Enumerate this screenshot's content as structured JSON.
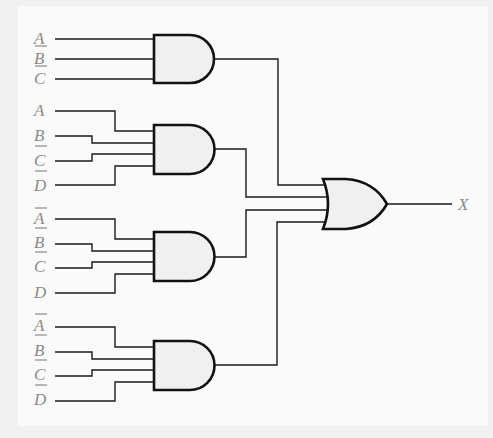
{
  "diagram": {
    "type": "logic-circuit",
    "output_label": "X",
    "colors": {
      "wire": "#1a1a1a",
      "gate_fill": "#f0f0f0",
      "label": "#8a8a8a",
      "background": "#f1f1f1"
    },
    "and_gates": [
      {
        "id": "and1",
        "inputs": [
          {
            "var": "A",
            "inverted": false
          },
          {
            "var": "B",
            "inverted": true
          },
          {
            "var": "C",
            "inverted": true
          }
        ]
      },
      {
        "id": "and2",
        "inputs": [
          {
            "var": "A",
            "inverted": false
          },
          {
            "var": "B",
            "inverted": false
          },
          {
            "var": "C",
            "inverted": true
          },
          {
            "var": "D",
            "inverted": true
          }
        ]
      },
      {
        "id": "and3",
        "inputs": [
          {
            "var": "A",
            "inverted": true
          },
          {
            "var": "B",
            "inverted": true
          },
          {
            "var": "C",
            "inverted": true
          },
          {
            "var": "D",
            "inverted": false
          }
        ]
      },
      {
        "id": "and4",
        "inputs": [
          {
            "var": "A",
            "inverted": true
          },
          {
            "var": "B",
            "inverted": true
          },
          {
            "var": "C",
            "inverted": true
          },
          {
            "var": "D",
            "inverted": true
          }
        ]
      }
    ],
    "or_gate": {
      "id": "or1",
      "inputs": [
        "and1",
        "and2",
        "and3",
        "and4"
      ],
      "output": "X"
    }
  },
  "labels": {
    "g1": [
      "A",
      "B",
      "C"
    ],
    "g2": [
      "A",
      "B",
      "C",
      "D"
    ],
    "g3": [
      "A",
      "B",
      "C",
      "D"
    ],
    "g4": [
      "A",
      "B",
      "C",
      "D"
    ],
    "out": "X"
  }
}
